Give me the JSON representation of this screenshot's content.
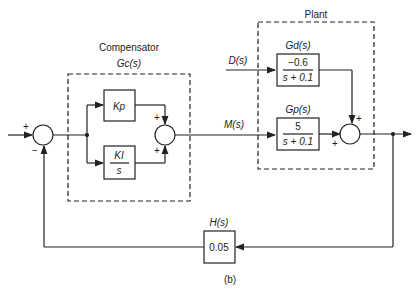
{
  "diagram": {
    "caption": "(b)",
    "compensator": {
      "title": "Compensator",
      "tf_label": "Gc(s)",
      "kp_block": "Kp",
      "ki_block_num": "KI",
      "ki_block_den": "s"
    },
    "plant": {
      "title": "Plant",
      "gd_label": "Gd(s)",
      "gd_num": "−0.6",
      "gd_den": "s + 0.1",
      "gp_label": "Gp(s)",
      "gp_num": "5",
      "gp_den": "s + 0.1"
    },
    "signals": {
      "disturbance": "D(s)",
      "manipulated": "M(s)"
    },
    "feedback": {
      "tf_label": "H(s)",
      "gain": "0.05"
    },
    "signs": {
      "sum1_plus": "+",
      "sum1_minus": "−",
      "sum2_top": "+",
      "sum2_bottom": "+",
      "sum3_top": "+",
      "sum3_left": "+"
    }
  }
}
